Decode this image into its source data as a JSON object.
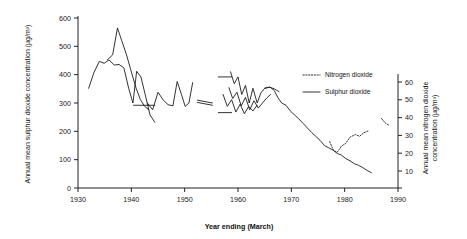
{
  "chart_data": {
    "type": "line",
    "title": "",
    "xlabel": "Year ending (March)",
    "ylabel": "Annual mean sulphur dioxide concentration (µg/m³)",
    "y2label": "Annual mean nitrogen dioxide concentration (µg/m³)",
    "xlim": [
      1930,
      1990
    ],
    "ylim": [
      0,
      600
    ],
    "y2lim": [
      0,
      65
    ],
    "grid": false,
    "legend_position": "right-upper",
    "xticks": [
      "1930",
      "1940",
      "1950",
      "1960",
      "1970",
      "1980",
      "1990"
    ],
    "xtick_values": [
      1930,
      1940,
      1950,
      1960,
      1970,
      1980,
      1990
    ],
    "yticks": [
      "0",
      "100",
      "200",
      "300",
      "400",
      "500",
      "600"
    ],
    "ytick_values": [
      0,
      100,
      200,
      300,
      400,
      500,
      600
    ],
    "y2ticks": [
      "10",
      "20",
      "30",
      "40",
      "50",
      "60"
    ],
    "y2tick_values": [
      10,
      20,
      30,
      40,
      50,
      60
    ],
    "legend": [
      {
        "label": "Nitrogen dioxide",
        "style": "dotted"
      },
      {
        "label": "Sulphur dioxide",
        "style": "solid"
      }
    ],
    "series": [
      {
        "name": "Sulphur dioxide - site A (1932-1949)",
        "axis": "left",
        "style": "solid",
        "points": [
          [
            1932.0,
            352
          ],
          [
            1933.0,
            408
          ],
          [
            1934.0,
            447
          ],
          [
            1934.9,
            440
          ],
          [
            1935.8,
            452
          ],
          [
            1936.8,
            434
          ],
          [
            1937.7,
            436
          ],
          [
            1938.6,
            424
          ],
          [
            1939.5,
            352
          ],
          [
            1940.3,
            300
          ],
          [
            1941.0,
            412
          ],
          [
            1941.8,
            392
          ],
          [
            1942.6,
            330
          ],
          [
            1943.5,
            258
          ],
          [
            1944.4,
            232
          ]
        ]
      },
      {
        "name": "Sulphur dioxide - site B (1935-1944)",
        "axis": "left",
        "style": "solid",
        "points": [
          [
            1935.5,
            452
          ],
          [
            1936.5,
            470
          ],
          [
            1937.4,
            565
          ],
          [
            1938.2,
            520
          ],
          [
            1939.1,
            470
          ],
          [
            1940.0,
            410
          ],
          [
            1940.9,
            352
          ],
          [
            1941.7,
            312
          ],
          [
            1942.5,
            288
          ],
          [
            1943.3,
            276
          ]
        ]
      },
      {
        "name": "Sulphur dioxide - site C (1943-1950)",
        "axis": "left",
        "style": "solid",
        "points": [
          [
            1943.0,
            300
          ],
          [
            1944.0,
            276
          ],
          [
            1945.0,
            338
          ],
          [
            1946.0,
            310
          ],
          [
            1946.9,
            294
          ],
          [
            1947.8,
            290
          ],
          [
            1948.6,
            376
          ],
          [
            1949.4,
            330
          ],
          [
            1950.1,
            288
          ],
          [
            1950.8,
            300
          ],
          [
            1951.5,
            372
          ]
        ]
      },
      {
        "name": "Sulphur dioxide - baseline marker (1940-1944)",
        "axis": "left",
        "style": "solid",
        "points": [
          [
            1940.4,
            292
          ],
          [
            1944.4,
            292
          ]
        ]
      },
      {
        "name": "Sulphur dioxide - break segment upper",
        "axis": "left",
        "style": "solid",
        "points": [
          [
            1952.4,
            310
          ],
          [
            1955.2,
            300
          ]
        ]
      },
      {
        "name": "Sulphur dioxide - break segment lower",
        "axis": "left",
        "style": "solid",
        "points": [
          [
            1952.4,
            302
          ],
          [
            1955.2,
            292
          ]
        ]
      },
      {
        "name": "Sulphur dioxide - marker 1957 upper",
        "axis": "left",
        "style": "solid",
        "points": [
          [
            1956.3,
            392
          ],
          [
            1958.8,
            392
          ]
        ]
      },
      {
        "name": "Sulphur dioxide - marker 1957 lower",
        "axis": "left",
        "style": "solid",
        "points": [
          [
            1956.3,
            266
          ],
          [
            1958.8,
            266
          ]
        ]
      },
      {
        "name": "Sulphur dioxide - site D (1958-1968)",
        "axis": "left",
        "style": "solid",
        "points": [
          [
            1958.6,
            410
          ],
          [
            1959.3,
            368
          ],
          [
            1960.0,
            392
          ],
          [
            1960.7,
            330
          ],
          [
            1961.4,
            362
          ],
          [
            1962.1,
            300
          ],
          [
            1962.8,
            352
          ],
          [
            1963.6,
            300
          ],
          [
            1964.3,
            336
          ],
          [
            1965.0,
            352
          ],
          [
            1965.9,
            356
          ],
          [
            1966.8,
            350
          ],
          [
            1967.7,
            340
          ]
        ]
      },
      {
        "name": "Sulphur dioxide - site E (1958-1966)",
        "axis": "left",
        "style": "solid",
        "points": [
          [
            1958.3,
            354
          ],
          [
            1959.0,
            316
          ],
          [
            1959.8,
            338
          ],
          [
            1960.6,
            290
          ],
          [
            1961.4,
            320
          ],
          [
            1962.2,
            276
          ],
          [
            1963.0,
            308
          ],
          [
            1963.8,
            282
          ],
          [
            1964.6,
            300
          ],
          [
            1965.4,
            318
          ],
          [
            1966.1,
            330
          ]
        ]
      },
      {
        "name": "Sulphur dioxide - site F (1957-1964)",
        "axis": "left",
        "style": "solid",
        "points": [
          [
            1957.2,
            330
          ],
          [
            1958.0,
            288
          ],
          [
            1958.8,
            312
          ],
          [
            1959.6,
            268
          ],
          [
            1960.4,
            296
          ],
          [
            1961.2,
            262
          ],
          [
            1962.0,
            288
          ],
          [
            1962.8,
            272
          ],
          [
            1963.6,
            292
          ]
        ]
      },
      {
        "name": "Sulphur dioxide - main trend (1965-1985)",
        "axis": "left",
        "style": "solid",
        "points": [
          [
            1965.0,
            352
          ],
          [
            1966.0,
            356
          ],
          [
            1966.8,
            344
          ],
          [
            1967.5,
            318
          ],
          [
            1968.2,
            300
          ],
          [
            1969.0,
            292
          ],
          [
            1969.8,
            272
          ],
          [
            1970.6,
            258
          ],
          [
            1971.4,
            244
          ],
          [
            1972.2,
            228
          ],
          [
            1973.0,
            212
          ],
          [
            1973.8,
            196
          ],
          [
            1974.6,
            182
          ],
          [
            1975.4,
            168
          ],
          [
            1976.2,
            150
          ],
          [
            1977.0,
            142
          ],
          [
            1977.8,
            134
          ],
          [
            1978.6,
            122
          ],
          [
            1979.4,
            116
          ],
          [
            1980.2,
            104
          ],
          [
            1981.0,
            96
          ],
          [
            1981.8,
            86
          ],
          [
            1982.6,
            80
          ],
          [
            1983.4,
            72
          ],
          [
            1984.2,
            62
          ],
          [
            1985.0,
            54
          ]
        ]
      },
      {
        "name": "Nitrogen dioxide (1977-1984)",
        "axis": "right",
        "style": "dotted",
        "points": [
          [
            1977.2,
            26.5
          ],
          [
            1977.9,
            21.5
          ],
          [
            1978.6,
            20.5
          ],
          [
            1979.4,
            24.0
          ],
          [
            1980.2,
            25.5
          ],
          [
            1981.0,
            29.0
          ],
          [
            1982.0,
            30.5
          ],
          [
            1982.8,
            29.5
          ],
          [
            1983.6,
            31.5
          ],
          [
            1984.4,
            32.5
          ]
        ]
      },
      {
        "name": "Nitrogen dioxide (1987-1989)",
        "axis": "right",
        "style": "dotted",
        "points": [
          [
            1986.9,
            39.5
          ],
          [
            1987.6,
            37.0
          ],
          [
            1988.4,
            35.5
          ]
        ]
      }
    ]
  },
  "colors": {
    "line": "#1c1c1c",
    "axis": "#222222",
    "text": "#111111"
  }
}
